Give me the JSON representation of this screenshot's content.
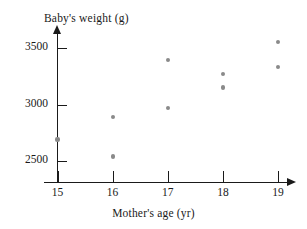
{
  "chart_data": {
    "type": "scatter",
    "title": "",
    "xlabel": "Mother's age (yr)",
    "ylabel": "Baby's weight (g)",
    "xlim": [
      14.6,
      19.4
    ],
    "ylim": [
      2300,
      3620
    ],
    "grid": false,
    "legend": "none",
    "xticks": [
      "15",
      "16",
      "17",
      "18",
      "19"
    ],
    "xtick_values": [
      15,
      16,
      17,
      18,
      19
    ],
    "yticks": [
      "2500",
      "3000",
      "3500"
    ],
    "ytick_values": [
      2500,
      3000,
      3500
    ],
    "points": [
      {
        "x": 15,
        "y": 2690
      },
      {
        "x": 16,
        "y": 2890
      },
      {
        "x": 16,
        "y": 2540
      },
      {
        "x": 17,
        "y": 3390
      },
      {
        "x": 17,
        "y": 2970
      },
      {
        "x": 18,
        "y": 3270
      },
      {
        "x": 18,
        "y": 3150
      },
      {
        "x": 19,
        "y": 3550
      },
      {
        "x": 19,
        "y": 3330
      }
    ],
    "marker_color": "#8a8a8a",
    "axis_color": "#1a1a1a"
  }
}
